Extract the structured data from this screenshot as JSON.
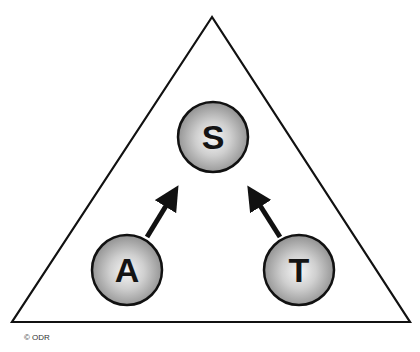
{
  "diagram": {
    "shape": "triangle",
    "nodes": [
      {
        "id": "S",
        "label": "S",
        "position": "top-center"
      },
      {
        "id": "A",
        "label": "A",
        "position": "bottom-left"
      },
      {
        "id": "T",
        "label": "T",
        "position": "bottom-right"
      }
    ],
    "edges": [
      {
        "from": "A",
        "to": "S",
        "type": "arrow"
      },
      {
        "from": "T",
        "to": "S",
        "type": "arrow"
      }
    ]
  },
  "footer": {
    "copyright": "© ODR"
  },
  "colors": {
    "stroke": "#111111",
    "node_fill_center": "#f4f4f4",
    "node_fill_edge": "#8e8e8e"
  }
}
